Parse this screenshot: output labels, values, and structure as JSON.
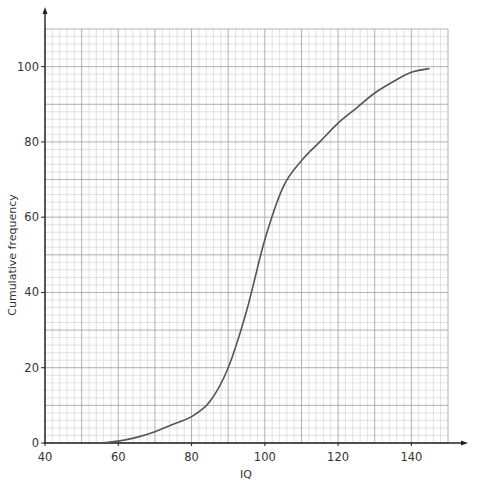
{
  "chart_data": {
    "type": "line",
    "title": "",
    "xlabel": "IQ",
    "ylabel": "Cumulative frequency",
    "xlim": [
      40,
      150
    ],
    "ylim": [
      0,
      110
    ],
    "x_ticks": [
      40,
      60,
      80,
      100,
      120,
      140
    ],
    "y_ticks": [
      0,
      20,
      40,
      60,
      80,
      100
    ],
    "grid": {
      "on": true,
      "major_x": 10,
      "minor_x": 2,
      "major_y": 10,
      "minor_y": 2
    },
    "legend": null,
    "series": [
      {
        "name": "Cumulative frequency curve",
        "x": [
          55,
          60,
          65,
          70,
          75,
          80,
          85,
          90,
          95,
          100,
          105,
          110,
          115,
          120,
          125,
          130,
          135,
          140,
          145
        ],
        "values": [
          0,
          0.5,
          1.5,
          3,
          5,
          7,
          11,
          20,
          35,
          54,
          68,
          75,
          80,
          85,
          89,
          93,
          96,
          98.5,
          99.5
        ]
      }
    ]
  },
  "colors": {
    "grid_minor": "#d9d9d9",
    "grid_major": "#a8a8a8",
    "axis": "#222222",
    "curve": "#555555"
  }
}
